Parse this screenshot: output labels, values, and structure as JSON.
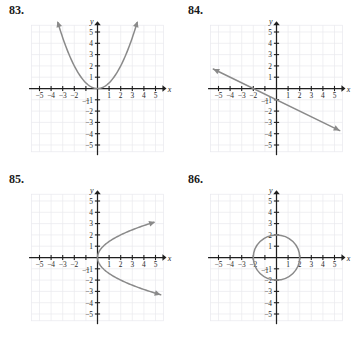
{
  "page": {
    "background": "#ffffff",
    "width": 358,
    "height": 339
  },
  "style": {
    "curve_color": "#8a8a8a",
    "axis_color": "#1f1f1f",
    "grid_color": "#e9e9ee",
    "grid_major_color": "#dedee6",
    "label_color": "#2b2b2b",
    "number_color": "#1a1a1a"
  },
  "axes_common": {
    "x_label": "x",
    "y_label": "y",
    "x_ticks": [
      "-5",
      "-4",
      "-3",
      "-2",
      "-1",
      "1",
      "2",
      "3",
      "4",
      "5"
    ],
    "y_ticks": [
      "5",
      "4",
      "3",
      "2",
      "1",
      "-1",
      "-2",
      "-3",
      "-4",
      "-5"
    ],
    "xlim": [
      -6,
      6
    ],
    "ylim": [
      -6,
      6
    ],
    "grid": true,
    "grid_step": 1
  },
  "panels": [
    {
      "number": "83.",
      "chart_data": {
        "type": "line",
        "title": "83.",
        "xlabel": "x",
        "ylabel": "y",
        "xlim": [
          -6,
          6
        ],
        "ylim": [
          -6,
          6
        ],
        "grid": true,
        "legend": "none",
        "curve_kind": "parabola-up",
        "equation": "y = x^2/2",
        "vertex": [
          0,
          0
        ],
        "arrow_start": true,
        "arrow_end": true,
        "points": [
          [
            -3.4,
            5.8
          ],
          [
            -3.0,
            4.5
          ],
          [
            -2.5,
            3.13
          ],
          [
            -2.0,
            2.0
          ],
          [
            -1.5,
            1.13
          ],
          [
            -1.0,
            0.5
          ],
          [
            -0.5,
            0.13
          ],
          [
            0,
            0
          ],
          [
            0.5,
            0.13
          ],
          [
            1.0,
            0.5
          ],
          [
            1.5,
            1.13
          ],
          [
            2.0,
            2.0
          ],
          [
            2.5,
            3.13
          ],
          [
            3.0,
            4.5
          ],
          [
            3.4,
            5.8
          ]
        ]
      }
    },
    {
      "number": "84.",
      "chart_data": {
        "type": "line",
        "title": "84.",
        "xlabel": "x",
        "ylabel": "y",
        "xlim": [
          -6,
          6
        ],
        "ylim": [
          -6,
          6
        ],
        "grid": true,
        "legend": "none",
        "curve_kind": "straight-line",
        "equation": "y = -x/2 - 1",
        "slope": -0.5,
        "y_intercept": -1,
        "x_intercept": -2,
        "arrow_start": true,
        "arrow_end": true,
        "points": [
          [
            -5.6,
            1.8
          ],
          [
            -2.0,
            0
          ],
          [
            0,
            -1
          ],
          [
            5.6,
            -3.8
          ]
        ]
      }
    },
    {
      "number": "85.",
      "chart_data": {
        "type": "line",
        "title": "85.",
        "xlabel": "x",
        "ylabel": "y",
        "xlim": [
          -6,
          6
        ],
        "ylim": [
          -6,
          6
        ],
        "grid": true,
        "legend": "none",
        "curve_kind": "parabola-right",
        "equation": "x = y^2/2",
        "vertex": [
          0,
          0
        ],
        "arrow_start": true,
        "arrow_end": true,
        "points": [
          [
            5.1,
            3.2
          ],
          [
            4.5,
            3.0
          ],
          [
            3.13,
            2.5
          ],
          [
            2.0,
            2.0
          ],
          [
            1.13,
            1.5
          ],
          [
            0.5,
            1.0
          ],
          [
            0.13,
            0.5
          ],
          [
            0,
            0
          ],
          [
            0.13,
            -0.5
          ],
          [
            0.5,
            -1.0
          ],
          [
            1.13,
            -1.5
          ],
          [
            2.0,
            -2.0
          ],
          [
            3.13,
            -2.5
          ],
          [
            4.5,
            -3.0
          ],
          [
            5.1,
            -3.4
          ]
        ]
      }
    },
    {
      "number": "86.",
      "chart_data": {
        "type": "line",
        "title": "86.",
        "xlabel": "x",
        "ylabel": "y",
        "xlim": [
          -6,
          6
        ],
        "ylim": [
          -6,
          6
        ],
        "grid": true,
        "legend": "none",
        "curve_kind": "circle",
        "equation": "x^2 + y^2 = 4",
        "center": [
          0,
          0
        ],
        "radius": 2,
        "arrow_start": false,
        "arrow_end": false,
        "points": [
          [
            2,
            0
          ],
          [
            0,
            2
          ],
          [
            -2,
            0
          ],
          [
            0,
            -2
          ]
        ]
      }
    }
  ]
}
